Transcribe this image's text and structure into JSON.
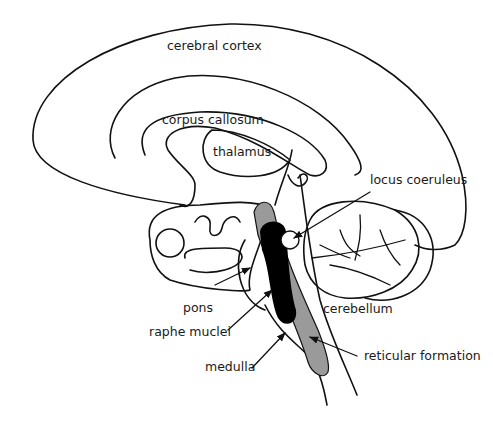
{
  "diagram": {
    "title": "",
    "labels": {
      "cerebral_cortex": "cerebral cortex",
      "corpus_callosum": "corpus callosum",
      "thalamus": "thalamus",
      "locus_coeruleus": "locus coeruleus",
      "pons": "pons",
      "raphe_nuclei": "raphe muclei",
      "medulla": "medulla",
      "cerebellum": "cerebellum",
      "reticular_formation": "reticular formation"
    },
    "colors": {
      "line": "#111111",
      "raphe_fill": "#000000",
      "reticular_fill": "#9a9a9a",
      "background": "#ffffff"
    }
  }
}
